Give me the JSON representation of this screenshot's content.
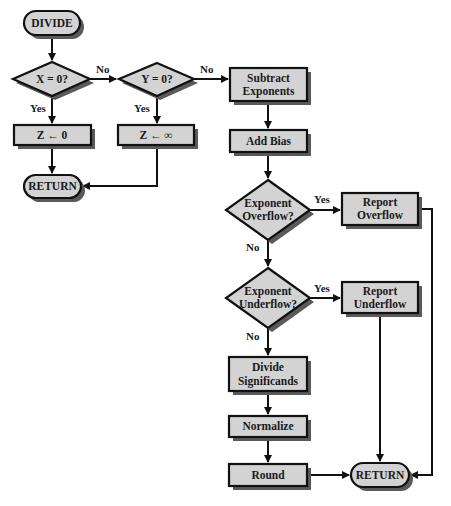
{
  "diagram": {
    "colors": {
      "fill": "#d3d3d3",
      "stroke": "#111111",
      "shadow": "#5a5a5a",
      "background": "#ffffff"
    },
    "nodes": {
      "divide": {
        "type": "terminal",
        "lines": [
          "DIVIDE"
        ]
      },
      "x_zero": {
        "type": "decision",
        "lines": [
          "X = 0?"
        ]
      },
      "y_zero": {
        "type": "decision",
        "lines": [
          "Y = 0?"
        ]
      },
      "z_zero": {
        "type": "process",
        "lines": [
          "Z ←  0"
        ]
      },
      "z_inf": {
        "type": "process",
        "lines": [
          "Z ← ∞"
        ]
      },
      "return1": {
        "type": "terminal",
        "lines": [
          "RETURN"
        ]
      },
      "subtract": {
        "type": "process",
        "lines": [
          "Subtract",
          "Exponents"
        ]
      },
      "add_bias": {
        "type": "process",
        "lines": [
          "Add Bias"
        ]
      },
      "overflow": {
        "type": "decision",
        "lines": [
          "Exponent",
          "Overflow?"
        ]
      },
      "report_overflow": {
        "type": "process",
        "lines": [
          "Report",
          "Overflow"
        ]
      },
      "underflow": {
        "type": "decision",
        "lines": [
          "Exponent",
          "Underflow?"
        ]
      },
      "report_underflow": {
        "type": "process",
        "lines": [
          "Report",
          "Underflow"
        ]
      },
      "divide_sig": {
        "type": "process",
        "lines": [
          "Divide",
          "Significands"
        ]
      },
      "normalize": {
        "type": "process",
        "lines": [
          "Normalize"
        ]
      },
      "round": {
        "type": "process",
        "lines": [
          "Round"
        ]
      },
      "return2": {
        "type": "terminal",
        "lines": [
          "RETURN"
        ]
      }
    },
    "edge_labels": {
      "x_no": "No",
      "x_yes": "Yes",
      "y_no": "No",
      "y_yes": "Yes",
      "overflow_yes": "Yes",
      "overflow_no": "No",
      "underflow_yes": "Yes",
      "underflow_no": "No"
    },
    "edges": [
      [
        "divide",
        "x_zero",
        ""
      ],
      [
        "x_zero",
        "y_zero",
        "No"
      ],
      [
        "x_zero",
        "z_zero",
        "Yes"
      ],
      [
        "y_zero",
        "subtract",
        "No"
      ],
      [
        "y_zero",
        "z_inf",
        "Yes"
      ],
      [
        "z_zero",
        "return1",
        ""
      ],
      [
        "z_inf",
        "return1",
        ""
      ],
      [
        "subtract",
        "add_bias",
        ""
      ],
      [
        "add_bias",
        "overflow",
        ""
      ],
      [
        "overflow",
        "report_overflow",
        "Yes"
      ],
      [
        "overflow",
        "underflow",
        "No"
      ],
      [
        "underflow",
        "report_underflow",
        "Yes"
      ],
      [
        "underflow",
        "divide_sig",
        "No"
      ],
      [
        "divide_sig",
        "normalize",
        ""
      ],
      [
        "normalize",
        "round",
        ""
      ],
      [
        "round",
        "return2",
        ""
      ],
      [
        "report_underflow",
        "return2",
        ""
      ],
      [
        "report_overflow",
        "return2",
        ""
      ]
    ]
  }
}
